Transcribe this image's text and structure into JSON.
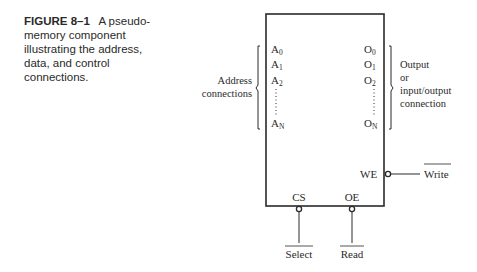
{
  "caption": {
    "figure_label": "FIGURE 8–1",
    "text": "A pseudo-memory component illustrating the address, data, and control connections."
  },
  "component": {
    "address_pins": [
      "A0",
      "A1",
      "A2",
      "AN"
    ],
    "output_pins": [
      "O0",
      "O1",
      "O2",
      "ON"
    ],
    "control_pins": {
      "we": "WE",
      "cs": "CS",
      "oe": "OE"
    }
  },
  "labels": {
    "address_group": [
      "Address",
      "connections"
    ],
    "output_group": [
      "Output",
      "or",
      "input/output",
      "connection"
    ],
    "write_signal": "Write",
    "select_signal": "Select",
    "read_signal": "Read"
  },
  "colors": {
    "line": "#2a2a2a",
    "background": "#ffffff"
  }
}
